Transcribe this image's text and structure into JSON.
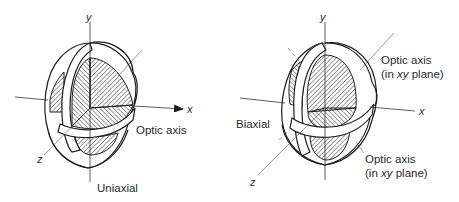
{
  "figure": {
    "uniaxial": {
      "title": "Uniaxial",
      "axis_x": "x",
      "axis_y": "y",
      "axis_z": "z",
      "annotation": "Optic axis"
    },
    "biaxial": {
      "title": "Biaxial",
      "axis_x": "x",
      "axis_y": "y",
      "axis_z": "z",
      "annotation_top_line1": "Optic axis",
      "annotation_top_line2_prefix": "(in ",
      "annotation_top_line2_italic": "xy",
      "annotation_top_line2_suffix": " plane)",
      "annotation_bottom_line1": "Optic axis",
      "annotation_bottom_line2_prefix": "(in ",
      "annotation_bottom_line2_italic": "xy",
      "annotation_bottom_line2_suffix": " plane)"
    }
  },
  "colors": {
    "ink": "#1e1e1e",
    "background": "#ffffff"
  }
}
